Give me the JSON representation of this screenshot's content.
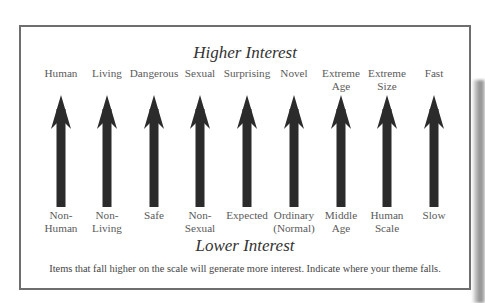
{
  "diagram": {
    "title_top": "Higher Interest",
    "title_bottom": "Lower Interest",
    "caption": "Items that fall higher on the scale will generate more interest. Indicate where your theme falls.",
    "arrow_color": "#2b2b2b",
    "scales": [
      {
        "high": "Human",
        "low": "Non-\nHuman"
      },
      {
        "high": "Living",
        "low": "Non-\nLiving"
      },
      {
        "high": "Dangerous",
        "low": "Safe"
      },
      {
        "high": "Sexual",
        "low": "Non-\nSexual"
      },
      {
        "high": "Surprising",
        "low": "Expected"
      },
      {
        "high": "Novel",
        "low": "Ordinary\n(Normal)"
      },
      {
        "high": "Extreme\nAge",
        "low": "Middle\nAge"
      },
      {
        "high": "Extreme\nSize",
        "low": "Human\nScale"
      },
      {
        "high": "Fast",
        "low": "Slow"
      }
    ]
  }
}
